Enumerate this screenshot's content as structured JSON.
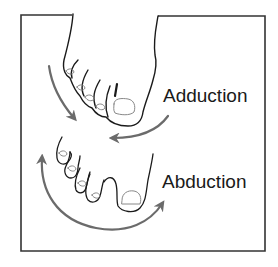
{
  "figure": {
    "labels": {
      "adduction": "Adduction",
      "abduction": "Abduction"
    },
    "icons": {
      "top_foot": "foot-toes-together-icon",
      "bottom_foot": "foot-toes-spread-icon",
      "adduction_arrows": "inward-curved-arrows-icon",
      "abduction_arrow": "outward-double-curved-arrow-icon"
    },
    "colors": {
      "frame": "#333333",
      "outline": "#1a1a1a",
      "nail": "#888888",
      "arrow": "#6b6b6b",
      "background": "#ffffff"
    }
  }
}
